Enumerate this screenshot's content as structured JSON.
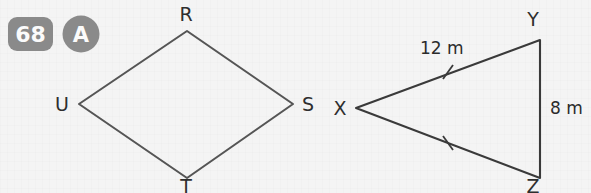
{
  "badges": {
    "number": "68",
    "letter": "A",
    "badge_color": "#8a8a8a",
    "text_color": "#fbfbfb"
  },
  "figure": {
    "stroke_color": "#555555",
    "background_color": "#f4f4f4",
    "shapes": [
      {
        "name": "kite-RSTU",
        "type": "quadrilateral",
        "vertices": [
          {
            "label": "R",
            "x": 187,
            "y": 31
          },
          {
            "label": "S",
            "x": 293,
            "y": 104
          },
          {
            "label": "T",
            "x": 187,
            "y": 178
          },
          {
            "label": "U",
            "x": 79,
            "y": 104
          }
        ],
        "vertex_labels": [
          {
            "label": "R",
            "x": 186,
            "y": 21
          },
          {
            "label": "S",
            "x": 308,
            "y": 111
          },
          {
            "label": "T",
            "x": 186,
            "y": 193
          },
          {
            "label": "U",
            "x": 62,
            "y": 111
          }
        ]
      },
      {
        "name": "triangle-XYZ",
        "type": "triangle",
        "vertices": [
          {
            "label": "X",
            "x": 356,
            "y": 108
          },
          {
            "label": "Y",
            "x": 540,
            "y": 40
          },
          {
            "label": "Z",
            "x": 540,
            "y": 178
          }
        ],
        "vertex_labels": [
          {
            "label": "X",
            "x": 340,
            "y": 115
          },
          {
            "label": "Y",
            "x": 533,
            "y": 26
          },
          {
            "label": "Z",
            "x": 533,
            "y": 193
          }
        ],
        "side_measures": [
          {
            "side": "XY",
            "value": "12 m",
            "x": 420,
            "y": 54
          },
          {
            "side": "YZ",
            "value": "8 m",
            "x": 550,
            "y": 114
          }
        ],
        "congruence_ticks": [
          {
            "side": "XY",
            "x": 448,
            "y": 72
          },
          {
            "side": "XZ",
            "x": 448,
            "y": 143
          }
        ]
      }
    ]
  }
}
